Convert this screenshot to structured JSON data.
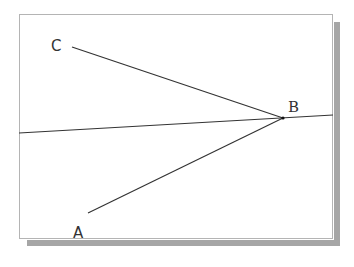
{
  "diagram": {
    "type": "geometry-angle",
    "points": {
      "A": {
        "label": "A",
        "x": 88,
        "y": 213
      },
      "B": {
        "label": "B",
        "x": 283,
        "y": 118
      },
      "C": {
        "label": "C",
        "x": 72,
        "y": 47
      }
    },
    "labels": [
      {
        "id": "C",
        "text": "C",
        "x": 51,
        "y": 51
      },
      {
        "id": "B",
        "text": "B",
        "x": 288,
        "y": 112
      },
      {
        "id": "A",
        "text": "A",
        "x": 73,
        "y": 238
      }
    ],
    "segments": [
      {
        "name": "segment-cb",
        "from": "C",
        "to": "B"
      },
      {
        "name": "segment-ab",
        "from": "A",
        "to": "B"
      }
    ],
    "line": {
      "name": "line-through-b",
      "x1": 19,
      "y1": 133,
      "x2": 333,
      "y2": 115
    },
    "colors": {
      "line": "#333333",
      "frame_border": "#b4b4b4",
      "shadow": "#a6a6a6",
      "background": "#ffffff"
    }
  }
}
